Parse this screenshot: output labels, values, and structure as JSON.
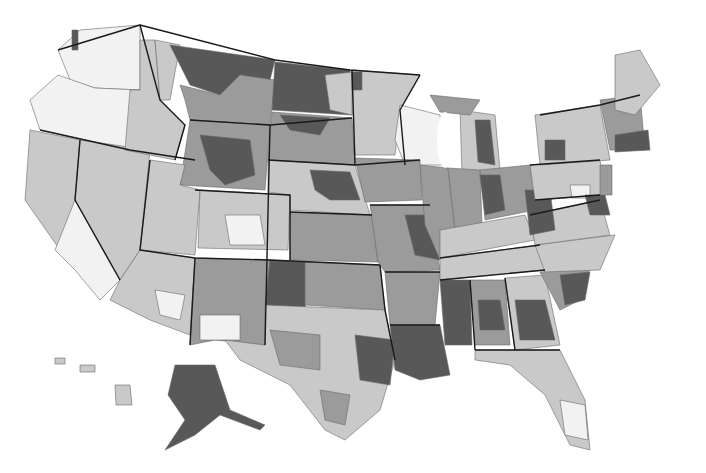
{
  "map": {
    "type": "choropleth",
    "subject": "United States hospital referral regions (grayscale)",
    "legend_visible": false,
    "palette": {
      "class_1": "#f2f2f2",
      "class_2": "#c9c9c9",
      "class_3": "#9b9b9b",
      "class_4": "#585858"
    },
    "regions": [
      {
        "id": "wa",
        "shade": "class_1",
        "points": "80,30 140,25 140,90 95,88 70,80 58,50"
      },
      {
        "id": "wa-puget",
        "shade": "class_4",
        "points": "72,30 78,30 78,50 72,50"
      },
      {
        "id": "or",
        "shade": "class_1",
        "points": "58,75 95,88 140,90 130,150 40,130 30,100"
      },
      {
        "id": "ca-north",
        "shade": "class_2",
        "points": "30,130 80,140 75,200 110,250 60,250 25,200"
      },
      {
        "id": "ca-south",
        "shade": "class_1",
        "points": "75,200 110,250 120,280 100,300 75,270 55,250"
      },
      {
        "id": "nv",
        "shade": "class_2",
        "points": "80,140 150,150 140,250 120,280 75,200"
      },
      {
        "id": "id",
        "shade": "class_2",
        "points": "140,40 155,40 160,100 185,125 175,160 125,150 130,90 140,90"
      },
      {
        "id": "mt-west",
        "shade": "class_2",
        "points": "155,40 180,45 170,100 160,100"
      },
      {
        "id": "mt-north",
        "shade": "class_4",
        "points": "170,45 275,60 270,80 240,75 220,95 190,85"
      },
      {
        "id": "mt-main",
        "shade": "class_3",
        "points": "180,85 220,95 240,75 275,80 270,125 190,120 185,100"
      },
      {
        "id": "nd",
        "shade": "class_4",
        "points": "275,62 350,70 352,115 272,110"
      },
      {
        "id": "nd-east",
        "shade": "class_2",
        "points": "325,75 352,72 352,115 330,110"
      },
      {
        "id": "sd",
        "shade": "class_3",
        "points": "272,112 352,118 355,165 268,160"
      },
      {
        "id": "sd-north",
        "shade": "class_4",
        "points": "280,115 330,118 320,135 290,130"
      },
      {
        "id": "wy",
        "shade": "class_3",
        "points": "190,120 270,125 265,190 180,185"
      },
      {
        "id": "wy-center",
        "shade": "class_4",
        "points": "200,135 250,140 255,175 225,185 210,170"
      },
      {
        "id": "ut",
        "shade": "class_2",
        "points": "150,160 185,165 180,185 200,190 195,255 140,250"
      },
      {
        "id": "co",
        "shade": "class_2",
        "points": "200,190 290,195 288,250 198,248"
      },
      {
        "id": "co-white",
        "shade": "class_1",
        "points": "225,215 260,215 265,245 230,245"
      },
      {
        "id": "ne",
        "shade": "class_2",
        "points": "268,160 355,165 370,215 290,210 290,195 268,192"
      },
      {
        "id": "ne-dark",
        "shade": "class_4",
        "points": "310,170 350,172 360,200 330,200 315,190"
      },
      {
        "id": "ks",
        "shade": "class_3",
        "points": "290,212 372,215 378,262 290,260"
      },
      {
        "id": "az",
        "shade": "class_2",
        "points": "140,250 195,258 190,335 150,320 110,300 120,280"
      },
      {
        "id": "az-white",
        "shade": "class_1",
        "points": "155,290 185,295 180,320 160,315"
      },
      {
        "id": "nm",
        "shade": "class_3",
        "points": "195,258 270,260 265,345 215,340 190,345"
      },
      {
        "id": "nm-white",
        "shade": "class_1",
        "points": "200,315 240,315 240,340 200,340"
      },
      {
        "id": "ok-pan",
        "shade": "class_4",
        "points": "270,260 310,262 305,310 265,305"
      },
      {
        "id": "ok",
        "shade": "class_3",
        "points": "305,262 380,265 385,310 305,305"
      },
      {
        "id": "tx",
        "shade": "class_2",
        "points": "265,305 385,310 395,360 380,410 345,440 325,430 290,385 240,360 225,340 265,345"
      },
      {
        "id": "tx-mid",
        "shade": "class_3",
        "points": "270,330 320,335 320,370 280,365"
      },
      {
        "id": "tx-east",
        "shade": "class_4",
        "points": "355,335 395,340 390,385 360,380"
      },
      {
        "id": "tx-south",
        "shade": "class_3",
        "points": "320,390 350,395 345,425 325,420"
      },
      {
        "id": "mn",
        "shade": "class_2",
        "points": "352,70 420,75 400,110 395,155 355,155"
      },
      {
        "id": "mn-nw",
        "shade": "class_4",
        "points": "352,72 362,72 362,90 352,90"
      },
      {
        "id": "wi",
        "shade": "class_1",
        "points": "400,105 440,115 445,165 405,165 395,140"
      },
      {
        "id": "ia",
        "shade": "class_3",
        "points": "355,158 420,160 422,200 365,202"
      },
      {
        "id": "mo",
        "shade": "class_3",
        "points": "370,205 430,205 440,270 385,272 378,262"
      },
      {
        "id": "mo-dark",
        "shade": "class_4",
        "points": "405,215 430,215 440,260 415,255"
      },
      {
        "id": "ar",
        "shade": "class_3",
        "points": "385,272 440,272 435,325 390,325"
      },
      {
        "id": "la",
        "shade": "class_4",
        "points": "390,325 440,325 450,375 420,380 395,370"
      },
      {
        "id": "il",
        "shade": "class_3",
        "points": "420,165 448,168 455,230 440,260 425,225"
      },
      {
        "id": "mi-lp",
        "shade": "class_2",
        "points": "460,110 495,115 500,170 462,175"
      },
      {
        "id": "mi-lp-dark",
        "shade": "class_4",
        "points": "475,120 490,120 495,165 478,162"
      },
      {
        "id": "mi-up",
        "shade": "class_3",
        "points": "430,95 480,100 470,115 440,112"
      },
      {
        "id": "in",
        "shade": "class_3",
        "points": "448,168 480,170 482,225 455,230"
      },
      {
        "id": "oh",
        "shade": "class_3",
        "points": "480,170 530,165 535,210 485,220"
      },
      {
        "id": "oh-dark",
        "shade": "class_4",
        "points": "480,175 500,175 505,210 485,215"
      },
      {
        "id": "ky",
        "shade": "class_2",
        "points": "440,230 525,215 535,240 440,258"
      },
      {
        "id": "tn",
        "shade": "class_2",
        "points": "440,258 540,245 545,270 440,280"
      },
      {
        "id": "ms",
        "shade": "class_4",
        "points": "440,280 470,280 472,345 445,345"
      },
      {
        "id": "al",
        "shade": "class_3",
        "points": "470,280 505,280 510,345 475,345"
      },
      {
        "id": "al-dark",
        "shade": "class_4",
        "points": "478,300 500,300 505,330 480,330"
      },
      {
        "id": "ga",
        "shade": "class_2",
        "points": "505,278 545,275 560,345 515,350"
      },
      {
        "id": "ga-dark",
        "shade": "class_4",
        "points": "515,300 545,300 555,340 520,340"
      },
      {
        "id": "fl",
        "shade": "class_2",
        "points": "475,350 560,350 585,400 590,450 570,445 545,395 510,365 475,360"
      },
      {
        "id": "fl-south",
        "shade": "class_1",
        "points": "560,400 585,405 588,440 565,435"
      },
      {
        "id": "sc",
        "shade": "class_3",
        "points": "540,272 590,268 580,300 560,310"
      },
      {
        "id": "sc-dark",
        "shade": "class_4",
        "points": "560,275 590,272 585,300 565,305"
      },
      {
        "id": "nc",
        "shade": "class_2",
        "points": "535,245 615,235 600,270 545,272"
      },
      {
        "id": "va",
        "shade": "class_2",
        "points": "530,215 600,200 610,235 535,245"
      },
      {
        "id": "wv",
        "shade": "class_4",
        "points": "525,190 550,190 555,230 530,235"
      },
      {
        "id": "pa",
        "shade": "class_2",
        "points": "530,165 600,160 605,195 535,200"
      },
      {
        "id": "pa-white",
        "shade": "class_1",
        "points": "570,185 590,185 590,198 572,198"
      },
      {
        "id": "ny",
        "shade": "class_2",
        "points": "535,115 600,105 610,160 540,165"
      },
      {
        "id": "ny-dark",
        "shade": "class_4",
        "points": "545,140 565,140 565,160 545,160"
      },
      {
        "id": "md-de",
        "shade": "class_4",
        "points": "585,195 605,195 610,215 590,215"
      },
      {
        "id": "nj",
        "shade": "class_3",
        "points": "600,165 612,165 612,195 600,195"
      },
      {
        "id": "ne-states",
        "shade": "class_3",
        "points": "600,100 640,95 645,150 610,150"
      },
      {
        "id": "ma",
        "shade": "class_4",
        "points": "615,135 648,130 650,150 615,152"
      },
      {
        "id": "me",
        "shade": "class_2",
        "points": "615,55 640,50 660,85 635,115 615,110"
      },
      {
        "id": "ak",
        "shade": "class_4",
        "points": "175,365 215,365 230,410 265,425 260,430 220,415 195,435 165,450 185,420 168,395"
      },
      {
        "id": "hi-1",
        "shade": "class_2",
        "points": "115,385 130,385 132,405 116,405"
      },
      {
        "id": "hi-2",
        "shade": "class_2",
        "points": "80,365 95,365 95,372 80,372"
      },
      {
        "id": "hi-3",
        "shade": "class_2",
        "points": "55,358 65,358 65,364 55,364"
      }
    ],
    "state_borders": [
      "M58,50 L140,25 L275,60 L350,70 L420,75",
      "M140,25 L160,100 L185,125 L175,160",
      "M40,130 L130,150 L195,160",
      "M80,140 L75,200 L120,280",
      "M190,120 L270,125 L352,118",
      "M150,160 L140,250 L195,258 L270,260 L380,265",
      "M195,190 L290,195 L290,260",
      "M268,160 L355,165 L420,160",
      "M352,70 L355,165",
      "M270,125 L265,345",
      "M195,258 L190,345",
      "M290,212 L372,215",
      "M380,265 L385,310 L395,360",
      "M385,272 L440,272",
      "M390,325 L440,325",
      "M420,75 L400,110 L405,165",
      "M370,205 L430,205",
      "M440,258 L540,245",
      "M440,280 L545,270",
      "M470,280 L475,350",
      "M505,278 L515,350",
      "M475,350 L560,350",
      "M530,165 L600,160",
      "M535,200 L600,195",
      "M530,215 L600,200",
      "M540,115 L600,105 L640,95"
    ]
  }
}
